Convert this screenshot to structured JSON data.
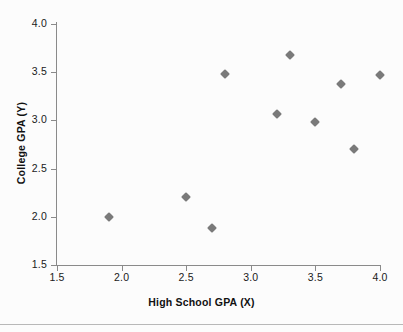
{
  "chart_data": {
    "type": "scatter",
    "title": "",
    "xlabel": "High School GPA (X)",
    "ylabel": "College GPA (Y)",
    "xlim": [
      1.5,
      4.0
    ],
    "ylim": [
      1.5,
      4.0
    ],
    "xticks": [
      "1.5",
      "2.0",
      "2.5",
      "3.0",
      "3.5",
      "4.0"
    ],
    "xtick_values": [
      1.5,
      2.0,
      2.5,
      3.0,
      3.5,
      4.0
    ],
    "yticks": [
      "1.5",
      "2.0",
      "2.5",
      "3.0",
      "3.5",
      "4.0"
    ],
    "ytick_values": [
      1.5,
      2.0,
      2.5,
      3.0,
      3.5,
      4.0
    ],
    "grid": false,
    "legend": false,
    "marker": "diamond",
    "marker_color": "#7a7a7a",
    "points": [
      {
        "x": 1.9,
        "y": 2.0
      },
      {
        "x": 2.5,
        "y": 2.21
      },
      {
        "x": 2.7,
        "y": 1.88
      },
      {
        "x": 2.8,
        "y": 3.48
      },
      {
        "x": 3.2,
        "y": 3.07
      },
      {
        "x": 3.3,
        "y": 3.68
      },
      {
        "x": 3.5,
        "y": 2.98
      },
      {
        "x": 3.7,
        "y": 3.38
      },
      {
        "x": 3.8,
        "y": 2.7
      },
      {
        "x": 4.0,
        "y": 3.47
      }
    ]
  }
}
